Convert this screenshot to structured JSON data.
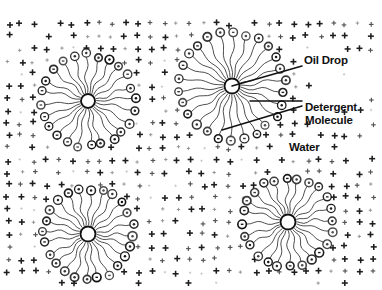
{
  "figure": {
    "type": "scientific-diagram",
    "background_color": "#ffffff",
    "ink_color": "#111111"
  },
  "labels": {
    "oil_drop": "Oil Drop",
    "detergent_line1": "Detergent",
    "detergent_line2": "Molecule",
    "water": "Water"
  },
  "legend_icons": {
    "water_molecule": "plus-sign",
    "detergent_head": "circle-with-minus",
    "detergent_tail": "wavy-line",
    "oil_drop_core": "open-circle"
  },
  "micelles": [
    {
      "name": "top-left",
      "cx": 88,
      "cy": 101,
      "core_r": 7.0,
      "ring_r": 46,
      "molecules": 24,
      "field_w": 150,
      "field_h": 140
    },
    {
      "name": "top-right",
      "cx": 232,
      "cy": 86,
      "core_r": 7.5,
      "ring_r": 53,
      "molecules": 26,
      "field_w": 168,
      "field_h": 156
    },
    {
      "name": "bottom-left",
      "cx": 88,
      "cy": 234,
      "core_r": 7.5,
      "ring_r": 45,
      "molecules": 24,
      "field_w": 150,
      "field_h": 132
    },
    {
      "name": "bottom-right",
      "cx": 288,
      "cy": 222,
      "core_r": 7.5,
      "ring_r": 45,
      "molecules": 24,
      "field_w": 152,
      "field_h": 134
    }
  ],
  "leader_lines": [
    {
      "name": "oil-drop-leader",
      "x1": 232,
      "y1": 86,
      "x2": 302,
      "y2": 66
    },
    {
      "name": "detergent-leader-upper",
      "x1": 250,
      "y1": 101,
      "x2": 302,
      "y2": 101
    },
    {
      "name": "detergent-leader-lower",
      "x1": 222,
      "y1": 130,
      "x2": 302,
      "y2": 106
    }
  ],
  "water_field": {
    "symbol": "+",
    "description": "dense field of plus signs representing polar water molecules"
  }
}
